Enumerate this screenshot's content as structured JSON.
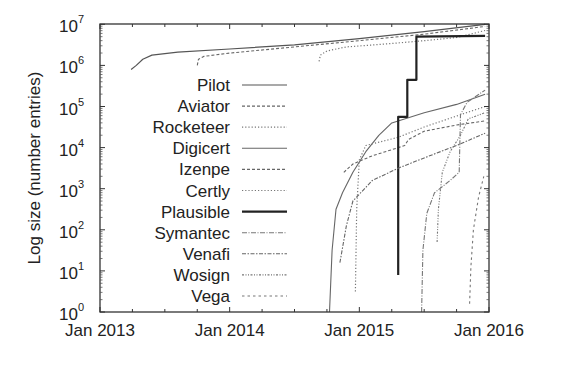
{
  "chart_data": {
    "type": "line",
    "title": "",
    "xlabel": "",
    "ylabel": "Log size (number entries)",
    "yscale": "log",
    "ylim": [
      1,
      15000000
    ],
    "xlim": [
      "Jan 2013",
      "Jan 2016"
    ],
    "x_ticks": [
      "Jan 2013",
      "Jan 2014",
      "Jan 2015",
      "Jan 2016"
    ],
    "y_ticks": [
      {
        "base": "10",
        "exp": "0"
      },
      {
        "base": "10",
        "exp": "1"
      },
      {
        "base": "10",
        "exp": "2"
      },
      {
        "base": "10",
        "exp": "3"
      },
      {
        "base": "10",
        "exp": "4"
      },
      {
        "base": "10",
        "exp": "5"
      },
      {
        "base": "10",
        "exp": "6"
      },
      {
        "base": "10",
        "exp": "7"
      }
    ],
    "grid": false,
    "legend_position": "inside-left",
    "x_unit": "fractional year",
    "y_unit": "log10(entries)",
    "series": [
      {
        "name": "Pilot",
        "style": "solid",
        "width": 1.2,
        "color": "#555555",
        "x": [
          2013.24,
          2013.28,
          2013.33,
          2013.4,
          2013.6,
          2014.0,
          2014.5,
          2015.0,
          2015.5,
          2015.97
        ],
        "y": [
          5.9,
          6.0,
          6.15,
          6.25,
          6.32,
          6.4,
          6.5,
          6.65,
          6.82,
          7.0
        ]
      },
      {
        "name": "Aviator",
        "style": "dashed",
        "width": 1.1,
        "color": "#666666",
        "x": [
          2013.75,
          2013.76,
          2013.8,
          2014.0,
          2014.5,
          2015.0,
          2015.5,
          2015.97
        ],
        "y": [
          6.0,
          6.15,
          6.22,
          6.3,
          6.45,
          6.6,
          6.76,
          6.95
        ]
      },
      {
        "name": "Rocketeer",
        "style": "dotted",
        "width": 1.2,
        "color": "#777777",
        "x": [
          2014.69,
          2014.7,
          2014.75,
          2014.9,
          2015.2,
          2015.5,
          2015.75,
          2015.97
        ],
        "y": [
          6.1,
          6.25,
          6.35,
          6.45,
          6.52,
          6.6,
          6.68,
          6.85
        ]
      },
      {
        "name": "Digicert",
        "style": "solid",
        "width": 1.1,
        "color": "#666666",
        "x": [
          2014.77,
          2014.79,
          2014.82,
          2014.87,
          2014.95,
          2015.05,
          2015.15,
          2015.25,
          2015.5,
          2015.75,
          2015.97
        ],
        "y": [
          0.0,
          1.5,
          2.5,
          2.9,
          3.4,
          3.9,
          4.3,
          4.6,
          4.85,
          5.05,
          5.3
        ]
      },
      {
        "name": "Izenpe",
        "style": "dashed",
        "width": 1.1,
        "color": "#666666",
        "x": [
          2014.88,
          2014.95,
          2015.1,
          2015.25,
          2015.35,
          2015.38,
          2015.5,
          2015.75,
          2015.97
        ],
        "y": [
          3.4,
          3.6,
          3.8,
          3.95,
          4.05,
          4.2,
          4.4,
          4.55,
          4.65
        ]
      },
      {
        "name": "Certly",
        "style": "dotted",
        "width": 1.2,
        "color": "#777777",
        "x": [
          2014.97,
          2014.98,
          2015.0,
          2015.05,
          2015.3,
          2015.5,
          2015.78,
          2015.97
        ],
        "y": [
          0.5,
          2.5,
          3.7,
          4.05,
          4.25,
          4.5,
          4.8,
          5.0
        ]
      },
      {
        "name": "Plausible",
        "style": "solid",
        "width": 2.2,
        "color": "#222222",
        "x": [
          2015.3,
          2015.3,
          2015.37,
          2015.37,
          2015.44,
          2015.44,
          2015.97
        ],
        "y": [
          0.9,
          4.75,
          4.75,
          5.65,
          5.65,
          6.7,
          6.72
        ]
      },
      {
        "name": "Symantec",
        "style": "dashdot",
        "width": 1.1,
        "color": "#777777",
        "x": [
          2015.48,
          2015.49,
          2015.52,
          2015.58,
          2015.7,
          2015.77,
          2015.78,
          2015.83,
          2015.97
        ],
        "y": [
          0.0,
          1.5,
          2.4,
          2.9,
          3.2,
          3.4,
          4.8,
          5.1,
          5.4
        ]
      },
      {
        "name": "Venafi",
        "style": "dashdot-long",
        "width": 1.1,
        "color": "#666666",
        "x": [
          2014.85,
          2014.9,
          2014.95,
          2015.1,
          2015.3,
          2015.5,
          2015.75,
          2015.97
        ],
        "y": [
          1.2,
          2.1,
          2.7,
          3.2,
          3.5,
          3.75,
          4.05,
          4.35
        ]
      },
      {
        "name": "Wosign",
        "style": "dashdotdot",
        "width": 1.1,
        "color": "#777777",
        "x": [
          2015.6,
          2015.61,
          2015.64,
          2015.7,
          2015.78,
          2015.84,
          2015.97
        ],
        "y": [
          1.7,
          2.5,
          3.4,
          3.9,
          4.3,
          4.7,
          4.85
        ]
      },
      {
        "name": "Vega",
        "style": "sparse-dash",
        "width": 1.1,
        "color": "#777777",
        "x": [
          2015.85,
          2015.86,
          2015.88,
          2015.92,
          2015.96
        ],
        "y": [
          0.2,
          1.1,
          2.0,
          2.8,
          3.3
        ]
      }
    ]
  },
  "layout": {
    "plot_left": 100,
    "plot_right": 489,
    "plot_top": 24,
    "plot_bottom": 312,
    "x_start_year": 2013,
    "px_per_year": 129.67,
    "px_per_decade": 41.1
  }
}
